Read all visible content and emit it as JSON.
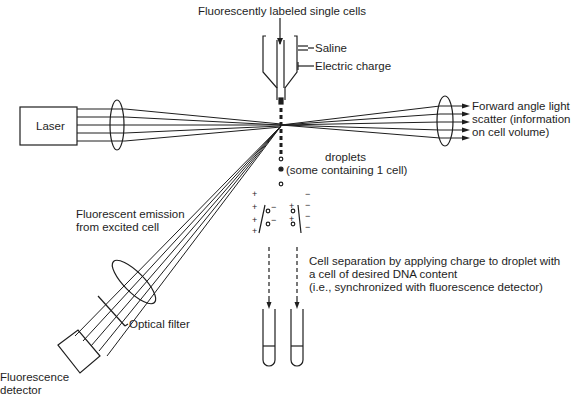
{
  "diagram": {
    "title_input": "Fluorescently labeled single cells",
    "labels": {
      "saline": "Saline",
      "electric_charge": "Electric charge",
      "laser": "Laser",
      "forward_scatter_1": "Forward angle light",
      "forward_scatter_2": "scatter (information",
      "forward_scatter_3": "on cell volume)",
      "droplets_1": "droplets",
      "droplets_2": "(some containing 1 cell)",
      "emission_1": "Fluorescent emission",
      "emission_2": "from excited cell",
      "separation_1": "Cell separation by applying charge to droplet with",
      "separation_2": "a cell of desired DNA content",
      "separation_3": "(i.e., synchronized with fluorescence detector)",
      "optical_filter": "Optical filter",
      "detector_1": "Fluorescence",
      "detector_2": "detector"
    },
    "plate_charges": {
      "left_plate": "+",
      "right_plate": "-",
      "left_droplets": "-",
      "right_droplets": "+"
    },
    "colors": {
      "ink": "#1e1e1e",
      "background": "#ffffff"
    }
  }
}
